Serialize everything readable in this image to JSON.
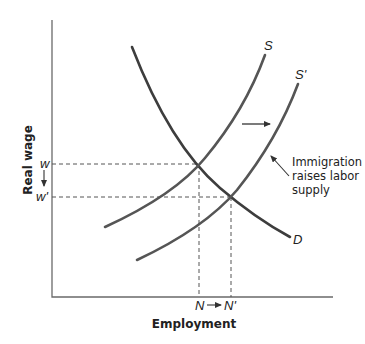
{
  "diagram": {
    "type": "supply-demand",
    "x_axis_label": "Employment",
    "y_axis_label": "Real wage",
    "curves": {
      "demand_label": "D",
      "supply_label": "S",
      "supply_shifted_label": "S'"
    },
    "y_markers": {
      "original": "w",
      "new": "w'"
    },
    "x_markers": {
      "original": "N",
      "new": "N'"
    },
    "annotation": {
      "line1": "Immigration",
      "line2": "raises labor",
      "line3": "supply"
    },
    "colors": {
      "curve": "#3d3d3d",
      "axis": "#6a6a6a",
      "text": "#222222"
    }
  }
}
